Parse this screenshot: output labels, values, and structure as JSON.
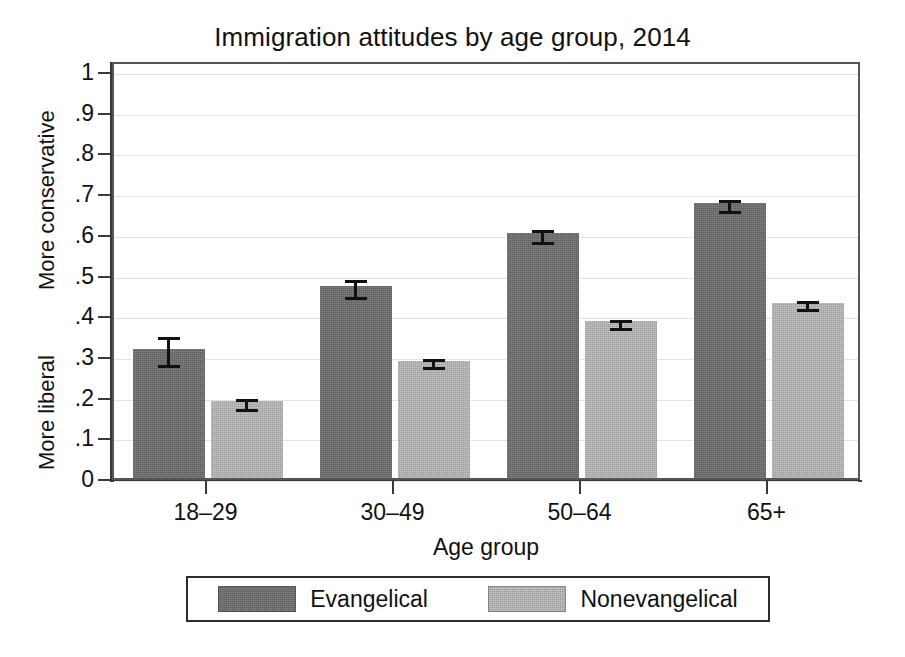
{
  "chart_data": {
    "type": "bar",
    "title": "Immigration attitudes by age group, 2014",
    "xlabel": "Age group",
    "ylabel_top": "More conservative",
    "ylabel_bottom": "More liberal",
    "categories": [
      "18–29",
      "30–49",
      "50–64",
      "65+"
    ],
    "ylim": [
      0,
      1
    ],
    "ytick_labels": [
      "0",
      ".1",
      ".2",
      ".3",
      ".4",
      ".5",
      ".6",
      ".7",
      ".8",
      ".9",
      "1"
    ],
    "ytick_values": [
      0,
      0.1,
      0.2,
      0.3,
      0.4,
      0.5,
      0.6,
      0.7,
      0.8,
      0.9,
      1
    ],
    "grid": true,
    "legend_position": "bottom",
    "error_bars": "95% confidence interval",
    "series": [
      {
        "name": "Evangelical",
        "color": "#6b6b6b",
        "values": [
          0.318,
          0.472,
          0.601,
          0.676
        ],
        "err_low": [
          0.281,
          0.448,
          0.583,
          0.659
        ],
        "err_high": [
          0.356,
          0.497,
          0.62,
          0.694
        ]
      },
      {
        "name": "Nonevangelical",
        "color": "#b2b2b2",
        "values": [
          0.188,
          0.288,
          0.385,
          0.43
        ],
        "err_low": [
          0.173,
          0.275,
          0.372,
          0.417
        ],
        "err_high": [
          0.204,
          0.302,
          0.399,
          0.444
        ]
      }
    ]
  },
  "legend": {
    "entries": [
      {
        "label": "Evangelical"
      },
      {
        "label": "Nonevangelical"
      }
    ]
  }
}
